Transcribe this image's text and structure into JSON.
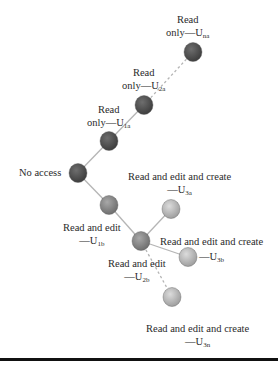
{
  "diagram": {
    "colors": {
      "dark_node": "#4a4a4a",
      "mid_node": "#7d7d7d",
      "light_node": "#b8b8b8",
      "edge": "#b5b5b5",
      "rule": "#111111"
    },
    "nodes": [
      {
        "id": "Una",
        "label_line1": "Read",
        "label_line2": "only—U",
        "sub": "na",
        "access": "Read only"
      },
      {
        "id": "U2a",
        "label_line1": "Read",
        "label_line2": "only—U",
        "sub": "2a",
        "access": "Read only"
      },
      {
        "id": "U1a",
        "label_line1": "Read",
        "label_line2": "only—U",
        "sub": "1a",
        "access": "Read only"
      },
      {
        "id": "none",
        "label_line1": "No access",
        "access": "No access"
      },
      {
        "id": "U1b",
        "label_line1": "Read and edit",
        "label_line2": "—U",
        "sub": "1b",
        "access": "Read and edit"
      },
      {
        "id": "U2b",
        "label_line1": "Read and edit",
        "label_line2": "—U",
        "sub": "2b",
        "access": "Read and edit"
      },
      {
        "id": "U3a",
        "label_line1": "Read and edit and create",
        "label_line2": "—U",
        "sub": "3a",
        "access": "Read and edit and create"
      },
      {
        "id": "U3b",
        "label_line1": "Read and edit and create",
        "label_line2": "—U",
        "sub": "3b",
        "access": "Read and edit and create"
      },
      {
        "id": "U3n",
        "label_line1": "Read and edit and create",
        "label_line2": "—U",
        "sub": "3n",
        "access": "Read and edit and create"
      }
    ],
    "edges": [
      {
        "from": "none",
        "to": "U1a",
        "style": "solid"
      },
      {
        "from": "U1a",
        "to": "U2a",
        "style": "solid"
      },
      {
        "from": "U2a",
        "to": "Una",
        "style": "dashed"
      },
      {
        "from": "none",
        "to": "U1b",
        "style": "solid"
      },
      {
        "from": "U1b",
        "to": "U2b",
        "style": "solid"
      },
      {
        "from": "U2b",
        "to": "U3a",
        "style": "solid"
      },
      {
        "from": "U2b",
        "to": "U3b",
        "style": "solid"
      },
      {
        "from": "U2b",
        "to": "U3n",
        "style": "dashed"
      }
    ]
  }
}
